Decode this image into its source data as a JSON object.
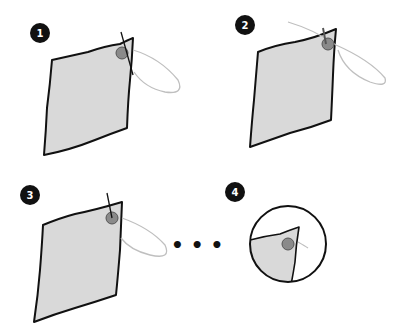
{
  "steps": [
    {
      "number": "1",
      "description": "Needle pierces fabric corner beside button, thread loop trailing"
    },
    {
      "number": "2",
      "description": "Needle passes through button, thread pulled across"
    },
    {
      "number": "3",
      "description": "Repeat stitches through button"
    },
    {
      "number": "4",
      "description": "Close-up of finished button sewn on corner"
    }
  ],
  "continuation": "• • •",
  "colors": {
    "fabric": "#d9d9d9",
    "outline": "#111111",
    "thread": "#bfbfbf",
    "button": "#8a8a8a",
    "badge": "#111111"
  }
}
